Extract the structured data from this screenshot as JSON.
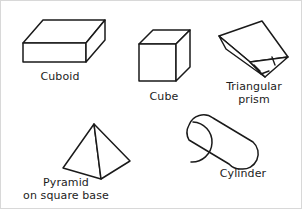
{
  "figure": {
    "background_color": "#ffffff",
    "line_color": "#1a1a1a",
    "border_color": "#d8d8d8",
    "width": 302,
    "height": 209,
    "style": "line drawing, black outline on white, no shading"
  },
  "shapes": [
    {
      "id": "cuboid",
      "label": "Cuboid",
      "label_lines": [
        "Cuboid"
      ],
      "kind": "cuboid",
      "row": 1,
      "column": 1,
      "visible_faces": [
        "top",
        "front",
        "right-side"
      ],
      "edges_visible": 9,
      "description": "Flat rectangular box drawn in oblique projection, wide top face"
    },
    {
      "id": "cube",
      "label": "Cube",
      "label_lines": [
        "Cube"
      ],
      "kind": "cube",
      "row": 1,
      "column": 2,
      "visible_faces": [
        "top",
        "front",
        "right-side"
      ],
      "edges_visible": 9,
      "description": "Equal-sided box drawn in oblique projection"
    },
    {
      "id": "triangular-prism",
      "label": "Triangular prism",
      "label_lines": [
        "Triangular",
        "prism"
      ],
      "kind": "triangular-prism",
      "row": 1,
      "column": 3,
      "visible_faces": [
        "top-rectangle",
        "front-rectangle",
        "end-triangle"
      ],
      "tick_marks": 3,
      "tick_meaning": "equal sides of the equilateral triangular end face",
      "description": "Prism tilted so the triangular end face points to the lower right"
    },
    {
      "id": "pyramid",
      "label": "Pyramid on square base",
      "label_lines": [
        "Pyramid",
        "on square base"
      ],
      "kind": "square-pyramid",
      "row": 2,
      "column": 1,
      "visible_faces": [
        "left-triangle",
        "right-triangle"
      ],
      "edges_visible": 5,
      "description": "Square-based pyramid with apex at top and a vertical front edge"
    },
    {
      "id": "cylinder",
      "label": "Cylinder",
      "label_lines": [
        "Cylinder"
      ],
      "kind": "cylinder",
      "row": 2,
      "column": 2,
      "visible_faces": [
        "curved-surface",
        "near-end-ellipse"
      ],
      "description": "Cylinder tilted up to the right, circular end visible at lower left"
    }
  ]
}
